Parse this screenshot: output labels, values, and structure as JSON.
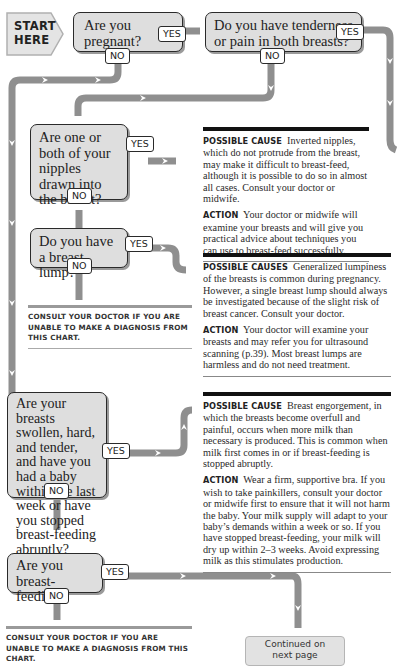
{
  "start": {
    "label_line1": "START",
    "label_line2": "HERE"
  },
  "questions": [
    {
      "id": "q1",
      "text": "Are you pregnant?",
      "yes": "YES",
      "no": "NO"
    },
    {
      "id": "q2",
      "text": "Do you have tenderness or pain in both breasts?",
      "yes": "YES",
      "no": "NO"
    },
    {
      "id": "q3",
      "text": "Are one or both of your nipples drawn into the breast?",
      "yes": "YES",
      "no": "NO"
    },
    {
      "id": "q4",
      "text": "Do you have a breast lump?",
      "yes": "YES",
      "no": "NO"
    },
    {
      "id": "q5",
      "text": "Are your breasts swollen, hard, and tender, and have you had a baby within the last week or have you stopped breast-feeding abruptly?",
      "yes": "YES",
      "no": "NO"
    },
    {
      "id": "q6",
      "text": "Are you breast-feeding?",
      "yes": "YES",
      "no": "NO"
    }
  ],
  "panels": [
    {
      "id": "inverted-nipples",
      "cause_label": "Possible cause",
      "cause_text": "Inverted nipples, which do not protrude from the breast, may make it difficult to breast-feed, although it is possible to do so in almost all cases. Consult your doctor or midwife.",
      "action_label": "Action",
      "action_text": "Your doctor or midwife will examine your breasts and will give you practical advice about techniques you can use to breast-feed successfully."
    },
    {
      "id": "breast-lump",
      "cause_label": "Possible causes",
      "cause_text": "Generalized lumpiness of the breasts is common during pregnancy. However, a single breast lump should always be investigated because of the slight risk of breast cancer. Consult your doctor.",
      "action_label": "Action",
      "action_text": "Your doctor will examine your breasts and may refer you for ultrasound scanning (p.39). Most breast lumps are harmless and do not need treatment."
    },
    {
      "id": "engorgement",
      "cause_label": "Possible cause",
      "cause_text": "Breast engorgement, in which the breasts become overfull and painful, occurs when more milk than necessary is produced. This is common when milk first comes in or if breast-feeding is stopped abruptly.",
      "action_label": "Action",
      "action_text": "Wear a firm, supportive bra. If you wish to take painkillers, consult your doctor or midwife first to ensure that it will not harm the baby. Your milk supply will adapt to your baby’s demands within a week or so. If you have stopped breast-feeding, your milk will dry up within 2–3 weeks. Avoid expressing milk as this stimulates production."
    }
  ],
  "consult_notes": [
    {
      "id": "consult-1",
      "text": "Consult your doctor if you are unable to make a diagnosis from this chart."
    },
    {
      "id": "consult-2",
      "text": "Consult your doctor if you are unable to make a diagnosis from this chart."
    }
  ],
  "continued": {
    "line1": "Continued on",
    "line2": "next page"
  },
  "colors": {
    "connector": "#8f8f8f",
    "box_fill": "#dedede",
    "box_border": "#2a2a2a",
    "panel_rule": "#111111"
  }
}
